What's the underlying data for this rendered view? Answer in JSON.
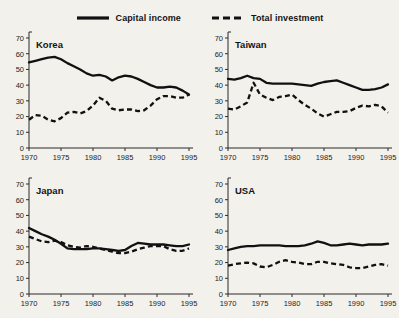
{
  "legend": {
    "entries": [
      {
        "label": "Capital income",
        "style": "solid",
        "color": "#111111"
      },
      {
        "label": "Total investment",
        "style": "dashed",
        "color": "#111111"
      }
    ]
  },
  "chart_data": {
    "type": "line",
    "title": "",
    "xlabel": "",
    "ylabel": "",
    "xlim": [
      1970,
      1995
    ],
    "ylim": [
      0,
      70
    ],
    "xticks": [
      1970,
      1975,
      1980,
      1985,
      1990,
      1995
    ],
    "yticks": [
      0,
      10,
      20,
      30,
      40,
      50,
      60,
      70
    ],
    "grid": false,
    "legend_position": "top-center",
    "panel_layout": "2x2",
    "x": [
      1970,
      1971,
      1972,
      1973,
      1974,
      1975,
      1976,
      1977,
      1978,
      1979,
      1980,
      1981,
      1982,
      1983,
      1984,
      1985,
      1986,
      1987,
      1988,
      1989,
      1990,
      1991,
      1992,
      1993,
      1994,
      1995
    ],
    "panels": [
      {
        "title": "Korea",
        "series": [
          {
            "name": "Capital income",
            "style": "solid",
            "values": [
              54.5,
              55.5,
              56.5,
              57.5,
              58.0,
              56.5,
              54.0,
              52.0,
              50.0,
              47.5,
              46.0,
              46.5,
              45.5,
              43.0,
              45.0,
              46.0,
              45.5,
              44.0,
              42.0,
              40.0,
              38.5,
              38.5,
              39.0,
              38.5,
              36.5,
              34.0
            ]
          },
          {
            "name": "Total investment",
            "style": "dashed",
            "values": [
              18.0,
              21.0,
              20.5,
              18.0,
              17.0,
              19.0,
              22.5,
              23.0,
              22.0,
              23.5,
              27.0,
              32.0,
              30.0,
              25.0,
              24.0,
              24.5,
              24.5,
              23.5,
              24.0,
              27.0,
              31.0,
              33.0,
              33.0,
              32.0,
              32.0,
              34.0
            ]
          }
        ]
      },
      {
        "title": "Taiwan",
        "series": [
          {
            "name": "Capital income",
            "style": "solid",
            "values": [
              44.0,
              43.5,
              44.5,
              46.0,
              44.5,
              44.0,
              41.5,
              41.0,
              41.0,
              41.0,
              41.0,
              40.5,
              40.0,
              39.5,
              41.0,
              42.0,
              42.5,
              43.0,
              41.5,
              40.0,
              38.5,
              37.0,
              37.0,
              37.5,
              38.5,
              40.5
            ]
          },
          {
            "name": "Total investment",
            "style": "dashed",
            "values": [
              25.0,
              24.5,
              26.5,
              29.0,
              41.5,
              34.0,
              32.0,
              30.5,
              32.5,
              33.0,
              34.0,
              30.5,
              27.5,
              25.0,
              22.0,
              20.0,
              21.5,
              23.0,
              23.0,
              23.5,
              25.5,
              27.0,
              26.5,
              27.5,
              26.5,
              22.5
            ]
          }
        ]
      },
      {
        "title": "Japan",
        "series": [
          {
            "name": "Capital income",
            "style": "solid",
            "values": [
              42.0,
              40.0,
              38.0,
              36.5,
              34.5,
              32.0,
              29.0,
              28.5,
              28.5,
              28.5,
              29.0,
              29.0,
              28.5,
              28.0,
              27.5,
              28.0,
              30.5,
              32.5,
              32.0,
              31.5,
              31.5,
              31.5,
              31.0,
              30.5,
              30.5,
              31.5
            ]
          },
          {
            "name": "Total investment",
            "style": "dashed",
            "values": [
              36.5,
              35.0,
              33.5,
              33.0,
              34.0,
              33.0,
              31.0,
              30.0,
              29.5,
              30.5,
              30.0,
              29.0,
              28.0,
              27.0,
              26.0,
              26.0,
              27.0,
              28.5,
              29.5,
              30.5,
              30.5,
              30.5,
              28.5,
              27.5,
              27.5,
              29.0
            ]
          }
        ]
      },
      {
        "title": "USA",
        "series": [
          {
            "name": "Capital income",
            "style": "solid",
            "values": [
              28.0,
              29.0,
              30.0,
              30.5,
              30.5,
              31.0,
              31.0,
              31.0,
              31.0,
              30.5,
              30.5,
              30.5,
              31.0,
              32.0,
              33.5,
              32.5,
              31.0,
              31.0,
              31.5,
              32.0,
              31.5,
              31.0,
              31.5,
              31.5,
              31.5,
              32.0
            ]
          },
          {
            "name": "Total investment",
            "style": "dashed",
            "values": [
              18.0,
              19.0,
              19.5,
              20.0,
              19.5,
              17.5,
              17.0,
              18.5,
              20.5,
              21.5,
              20.5,
              20.0,
              19.0,
              19.0,
              20.5,
              20.5,
              19.5,
              19.0,
              18.5,
              17.0,
              16.5,
              16.5,
              17.5,
              18.5,
              19.0,
              18.0
            ]
          }
        ]
      }
    ]
  }
}
